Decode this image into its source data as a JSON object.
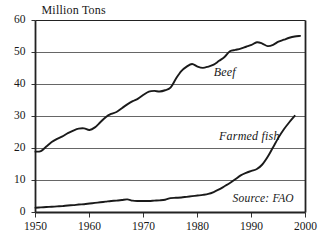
{
  "chart_data": {
    "type": "line",
    "title": "",
    "subtitle": "",
    "xlabel": "",
    "ylabel": "Million Tons",
    "xlim": [
      1950,
      2000
    ],
    "ylim": [
      0,
      60
    ],
    "grid": "horizontal",
    "legend_position": "inline-annotation",
    "xticks": [
      "1950",
      "1960",
      "1970",
      "1980",
      "1990",
      "2000"
    ],
    "xtick_values": [
      1950,
      1960,
      1970,
      1980,
      1990,
      2000
    ],
    "yticks": [
      "0",
      "10",
      "20",
      "30",
      "40",
      "50",
      "60"
    ],
    "ytick_values": [
      0,
      10,
      20,
      30,
      40,
      50,
      60
    ],
    "annotations": [
      {
        "text": "Beef",
        "x": 1983,
        "y": 43.5
      },
      {
        "text": "Farmed fish",
        "x": 1984,
        "y": 23.5
      },
      {
        "text": "Source: FAO",
        "x": 1986.5,
        "y": 4.0
      }
    ],
    "series": [
      {
        "name": "Beef",
        "color": "#1a1a1a",
        "x": [
          1950,
          1951,
          1952,
          1953,
          1954,
          1955,
          1956,
          1957,
          1958,
          1959,
          1960,
          1961,
          1962,
          1963,
          1964,
          1965,
          1966,
          1967,
          1968,
          1969,
          1970,
          1971,
          1972,
          1973,
          1974,
          1975,
          1976,
          1977,
          1978,
          1979,
          1980,
          1981,
          1982,
          1983,
          1984,
          1985,
          1986,
          1987,
          1988,
          1989,
          1990,
          1991,
          1992,
          1993,
          1994,
          1995,
          1996,
          1997,
          1998,
          1999
        ],
        "values": [
          19.0,
          19.2,
          20.6,
          22.0,
          23.0,
          23.8,
          24.8,
          25.6,
          26.2,
          26.3,
          25.8,
          26.6,
          28.2,
          29.8,
          30.8,
          31.4,
          32.6,
          33.8,
          34.8,
          35.6,
          36.8,
          37.8,
          38.0,
          37.8,
          38.2,
          39.0,
          41.8,
          44.2,
          45.6,
          46.4,
          45.6,
          45.2,
          45.6,
          46.2,
          47.4,
          48.6,
          50.4,
          50.8,
          51.2,
          51.8,
          52.4,
          53.2,
          52.8,
          52.0,
          52.4,
          53.4,
          54.0,
          54.6,
          55.0,
          55.2
        ]
      },
      {
        "name": "Farmed fish",
        "color": "#1a1a1a",
        "x": [
          1950,
          1951,
          1952,
          1953,
          1954,
          1955,
          1956,
          1957,
          1958,
          1959,
          1960,
          1961,
          1962,
          1963,
          1964,
          1965,
          1966,
          1967,
          1968,
          1969,
          1970,
          1971,
          1972,
          1973,
          1974,
          1975,
          1976,
          1977,
          1978,
          1979,
          1980,
          1981,
          1982,
          1983,
          1984,
          1985,
          1986,
          1987,
          1988,
          1989,
          1990,
          1991,
          1992,
          1993,
          1994,
          1995,
          1996,
          1997,
          1998
        ],
        "values": [
          1.5,
          1.6,
          1.7,
          1.8,
          1.9,
          2.0,
          2.2,
          2.3,
          2.5,
          2.6,
          2.8,
          3.0,
          3.2,
          3.4,
          3.6,
          3.7,
          3.9,
          4.1,
          3.7,
          3.6,
          3.6,
          3.6,
          3.7,
          3.8,
          4.0,
          4.5,
          4.6,
          4.7,
          4.9,
          5.1,
          5.3,
          5.5,
          5.8,
          6.4,
          7.2,
          8.2,
          9.2,
          10.4,
          11.6,
          12.4,
          13.0,
          13.6,
          15.0,
          17.4,
          20.4,
          23.4,
          26.0,
          28.2,
          30.2
        ]
      }
    ]
  },
  "figure": {
    "ylabel_text": "Million Tons"
  }
}
